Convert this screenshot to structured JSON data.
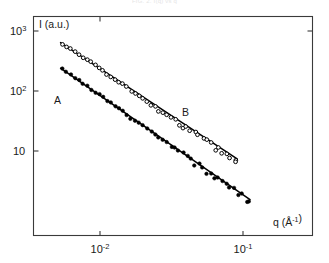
{
  "figure": {
    "top_caption_fragment": "FIG. 2. I(q) vs q",
    "background_color": "#ffffff",
    "axis_color": "#3a3a3a",
    "data_color": "#000000"
  },
  "chart_data": {
    "type": "scatter",
    "title": "",
    "subtitle": "",
    "xlabel": "q (Å⁻¹)",
    "ylabel": "I (a.u.)",
    "xscale": "log",
    "yscale": "log",
    "xlim": [
      0.0042,
      0.26
    ],
    "ylim": [
      1.05,
      1500
    ],
    "grid": false,
    "legend_position": "inline-annotation",
    "x_tick_labels": [
      "10⁻²",
      "10⁻¹"
    ],
    "x_tick_values": [
      0.01,
      0.1
    ],
    "y_tick_labels": [
      "10³",
      "10²",
      "10"
    ],
    "y_tick_values": [
      1000,
      100,
      10
    ],
    "annotations": [
      {
        "text": "A",
        "x": 0.0066,
        "y": 110
      },
      {
        "text": "B",
        "x": 0.042,
        "y": 27
      }
    ],
    "series": [
      {
        "name": "B",
        "label": "B",
        "marker": "circle-open",
        "color": "#000000",
        "fit_line": {
          "slope": -1.6,
          "x_start": 0.0053,
          "y_start": 640,
          "x_end": 0.091,
          "y_end": 7.4
        },
        "x": [
          0.00545,
          0.0058,
          0.00625,
          0.00668,
          0.00715,
          0.00762,
          0.00812,
          0.00868,
          0.00925,
          0.00985,
          0.0105,
          0.0112,
          0.01195,
          0.01275,
          0.0136,
          0.0145,
          0.01545,
          0.01648,
          0.01757,
          0.01874,
          0.01998,
          0.02131,
          0.02272,
          0.02423,
          0.02584,
          0.02756,
          0.02939,
          0.03134,
          0.03342,
          0.03564,
          0.03801,
          0.04053,
          0.04322,
          0.0461,
          0.04916,
          0.05243,
          0.05591,
          0.05962,
          0.06358,
          0.0678,
          0.0723,
          0.0771,
          0.08222,
          0.08768,
          0.091
        ],
        "y": [
          612,
          560,
          498,
          452,
          405,
          365,
          332,
          296,
          268,
          242,
          218,
          196,
          176,
          158,
          142,
          128,
          115,
          104,
          93,
          84,
          75,
          68,
          61,
          55,
          49,
          44,
          40,
          36,
          32,
          29,
          26,
          24,
          21.5,
          19.4,
          17.5,
          15.8,
          14.2,
          12.8,
          11.6,
          10.4,
          9.4,
          8.5,
          7.6,
          6.9,
          6.4
        ]
      },
      {
        "name": "A",
        "label": "A",
        "marker": "circle-filled",
        "color": "#000000",
        "fit_line": {
          "slope": -1.68,
          "x_start": 0.0053,
          "y_start": 240,
          "x_end": 0.112,
          "y_end": 1.55
        },
        "x": [
          0.00545,
          0.0058,
          0.00625,
          0.00668,
          0.00715,
          0.00762,
          0.00812,
          0.00868,
          0.00925,
          0.00985,
          0.0105,
          0.0112,
          0.01195,
          0.01275,
          0.0136,
          0.0145,
          0.01545,
          0.01648,
          0.01757,
          0.01874,
          0.01998,
          0.02131,
          0.02272,
          0.02423,
          0.02584,
          0.02756,
          0.02939,
          0.03134,
          0.03342,
          0.03564,
          0.03801,
          0.04053,
          0.04322,
          0.0461,
          0.04916,
          0.05243,
          0.05591,
          0.05962,
          0.06358,
          0.0678,
          0.0723,
          0.0771,
          0.08222,
          0.08768,
          0.0935,
          0.0997,
          0.1063,
          0.112
        ],
        "y": [
          232,
          210,
          186,
          166,
          149,
          133,
          119,
          107,
          96,
          86,
          77,
          69,
          62,
          55.5,
          49.8,
          44.6,
          40.0,
          35.9,
          32.2,
          28.9,
          25.9,
          23.2,
          20.8,
          18.7,
          16.7,
          15.0,
          13.5,
          12.1,
          10.8,
          9.7,
          8.7,
          7.8,
          7.0,
          6.3,
          5.6,
          5.05,
          4.53,
          4.07,
          3.65,
          3.27,
          2.94,
          2.63,
          2.36,
          2.12,
          1.9,
          1.7,
          1.53,
          1.4
        ]
      }
    ]
  }
}
